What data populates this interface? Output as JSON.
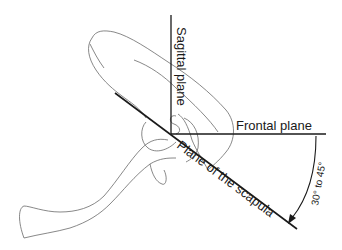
{
  "diagram": {
    "labels": {
      "sagittal": "Sagittal plane",
      "frontal": "Frontal plane",
      "scapula": "Plane of the scapula",
      "angle": "30° to 45°"
    },
    "colors": {
      "line": "#1a1a1a",
      "outline": "#6a6a6a",
      "background": "#ffffff"
    }
  }
}
